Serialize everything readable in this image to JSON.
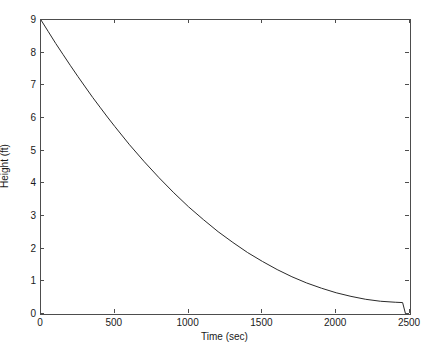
{
  "chart_data": {
    "type": "line",
    "title": "",
    "xlabel": "Time (sec)",
    "ylabel": "Height (ft)",
    "xlim": [
      0,
      2500
    ],
    "ylim": [
      0,
      9
    ],
    "xticks": [
      0,
      500,
      1000,
      1500,
      2000,
      2500
    ],
    "xticklabels": [
      "0",
      "500",
      "1000",
      "1500",
      "2000",
      "2500"
    ],
    "yticks": [
      0,
      1,
      2,
      3,
      4,
      5,
      6,
      7,
      8,
      9
    ],
    "yticklabels": [
      "0",
      "1",
      "2",
      "3",
      "4",
      "5",
      "6",
      "7",
      "8",
      "9"
    ],
    "grid": false,
    "legend": false,
    "box": true,
    "tick_direction": "in",
    "line_color": "#2a2a2a",
    "line_width": 1,
    "axis_color": "#4d4d4d",
    "background": "#ffffff",
    "series": [
      {
        "name": "tank height",
        "x": [
          0,
          50,
          100,
          150,
          200,
          250,
          300,
          350,
          400,
          450,
          500,
          600,
          700,
          800,
          900,
          1000,
          1100,
          1200,
          1300,
          1400,
          1500,
          1600,
          1700,
          1800,
          1900,
          2000,
          2100,
          2200,
          2300,
          2400,
          2450,
          2470
        ],
        "y": [
          9.0,
          8.64,
          8.28,
          7.94,
          7.6,
          7.27,
          6.95,
          6.63,
          6.33,
          6.03,
          5.74,
          5.18,
          4.66,
          4.17,
          3.71,
          3.28,
          2.89,
          2.52,
          2.19,
          1.88,
          1.61,
          1.36,
          1.14,
          0.95,
          0.79,
          0.65,
          0.54,
          0.45,
          0.39,
          0.36,
          0.35,
          0.0
        ]
      }
    ],
    "annotations": []
  }
}
